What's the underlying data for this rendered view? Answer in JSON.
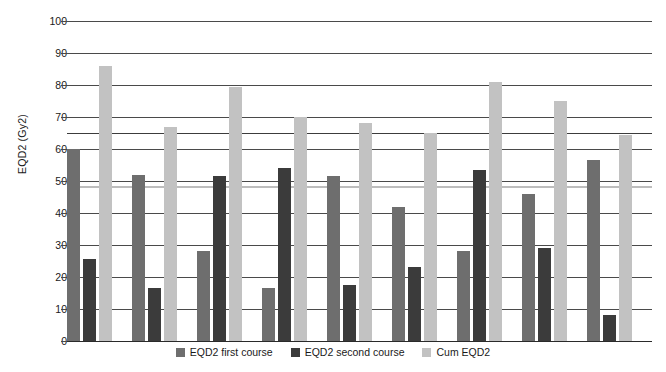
{
  "chart_data": {
    "type": "bar",
    "title": "",
    "xlabel": "",
    "ylabel": "EQD2 (Gy2)",
    "ylim": [
      0,
      100
    ],
    "ytick_step": 10,
    "yticks": [
      100,
      90,
      80,
      70,
      60,
      50,
      40,
      30,
      20,
      10,
      0
    ],
    "grid": true,
    "legend_position": "bottom",
    "categories": [
      "1",
      "2",
      "3",
      "4",
      "5",
      "6",
      "7",
      "8",
      "9"
    ],
    "series": [
      {
        "name": "EQD2 first course",
        "color": "#6e6e6e",
        "values": [
          60,
          52,
          28,
          16.5,
          51.5,
          42,
          28,
          46,
          56.5
        ]
      },
      {
        "name": "EQD2 second course",
        "color": "#3b3b3b",
        "values": [
          25.5,
          16.5,
          51.5,
          54,
          17.5,
          23,
          53.5,
          29,
          8
        ]
      },
      {
        "name": "Cum EQD2",
        "color": "#c2c2c2",
        "values": [
          86,
          67,
          79.5,
          70,
          68,
          65,
          81,
          75,
          64.5
        ]
      }
    ],
    "reference_lines": [
      {
        "name": "upper-constraint",
        "value": 65,
        "color": "#3c3c3c"
      },
      {
        "name": "lower-constraint",
        "value": 48.5,
        "color": "#bdbdbd"
      }
    ]
  },
  "axis": {
    "y_title": "EQD2 (Gy2)"
  },
  "legend": {
    "items": [
      {
        "label": "EQD2 first course",
        "color": "#6e6e6e"
      },
      {
        "label": "EQD2 second course",
        "color": "#3b3b3b"
      },
      {
        "label": "Cum EQD2",
        "color": "#c2c2c2"
      }
    ]
  }
}
